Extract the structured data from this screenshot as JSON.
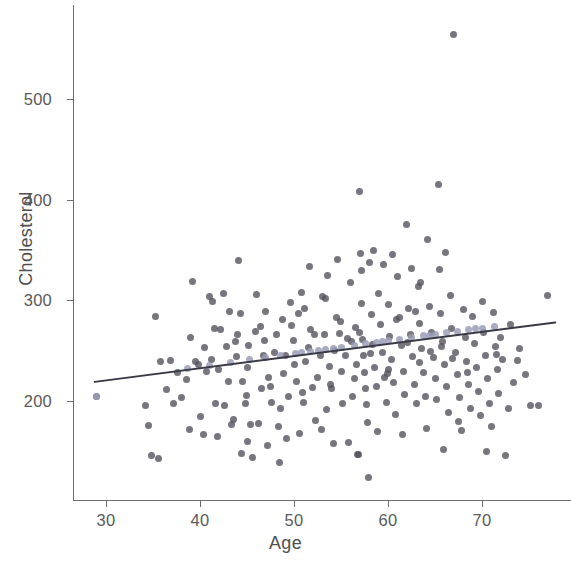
{
  "chart_data": {
    "type": "scatter",
    "title": "",
    "xlabel": "Age",
    "ylabel": "Cholesterol",
    "grid": false,
    "legend": null,
    "xlim": [
      26.5,
      79.5
    ],
    "ylim": [
      110,
      575
    ],
    "xticks": [
      30,
      40,
      50,
      60,
      70
    ],
    "xtick_labels": [
      "30",
      "40",
      "50",
      "60",
      "70"
    ],
    "yticks": [
      200,
      300,
      400,
      500
    ],
    "ytick_labels": [
      "200",
      "300",
      "400",
      "500"
    ],
    "series": [
      {
        "name": "observed",
        "marker": "circle",
        "color": "#55525c",
        "points": [
          [
            29,
            204
          ],
          [
            34.2,
            196
          ],
          [
            34.5,
            176
          ],
          [
            34.8,
            146
          ],
          [
            35.3,
            284
          ],
          [
            35.6,
            143
          ],
          [
            37.2,
            198
          ],
          [
            38.6,
            221
          ],
          [
            38.9,
            172
          ],
          [
            39.2,
            319
          ],
          [
            39.5,
            239
          ],
          [
            39.8,
            236
          ],
          [
            40.1,
            185
          ],
          [
            40.4,
            167
          ],
          [
            40.7,
            229
          ],
          [
            41.0,
            304
          ],
          [
            41.3,
            299
          ],
          [
            41.6,
            198
          ],
          [
            41.9,
            165
          ],
          [
            42.2,
            271
          ],
          [
            42.5,
            307
          ],
          [
            42.8,
            254
          ],
          [
            43.1,
            289
          ],
          [
            43.4,
            177
          ],
          [
            43.6,
            182
          ],
          [
            43.9,
            244
          ],
          [
            44.1,
            340
          ],
          [
            44.3,
            287
          ],
          [
            44.5,
            219
          ],
          [
            44.8,
            198
          ],
          [
            45.0,
            233
          ],
          [
            45.2,
            255
          ],
          [
            45.4,
            177
          ],
          [
            45.6,
            144
          ],
          [
            45.9,
            269
          ],
          [
            46.2,
            178
          ],
          [
            46.5,
            212
          ],
          [
            46.8,
            245
          ],
          [
            47.0,
            289
          ],
          [
            47.3,
            223
          ],
          [
            47.6,
            199
          ],
          [
            47.9,
            248
          ],
          [
            48.1,
            266
          ],
          [
            48.4,
            175
          ],
          [
            48.6,
            193
          ],
          [
            48.9,
            227
          ],
          [
            49.1,
            245
          ],
          [
            49.4,
            204
          ],
          [
            49.6,
            298
          ],
          [
            49.9,
            260
          ],
          [
            50.1,
            236
          ],
          [
            50.3,
            219
          ],
          [
            50.5,
            287
          ],
          [
            50.8,
            308
          ],
          [
            51.0,
            199
          ],
          [
            51.2,
            239
          ],
          [
            51.5,
            253
          ],
          [
            51.8,
            271
          ],
          [
            52.0,
            213
          ],
          [
            52.3,
            181
          ],
          [
            52.5,
            223
          ],
          [
            52.8,
            245
          ],
          [
            53.0,
            304
          ],
          [
            53.2,
            266
          ],
          [
            53.5,
            192
          ],
          [
            53.8,
            234
          ],
          [
            54.0,
            212
          ],
          [
            54.3,
            250
          ],
          [
            54.5,
            283
          ],
          [
            54.8,
            267
          ],
          [
            55.0,
            229
          ],
          [
            55.2,
            198
          ],
          [
            55.5,
            245
          ],
          [
            55.7,
            262
          ],
          [
            56.0,
            318
          ],
          [
            56.2,
            204
          ],
          [
            56.5,
            273
          ],
          [
            56.7,
            236
          ],
          [
            56.9,
            147
          ],
          [
            57.0,
            408
          ],
          [
            57.1,
            347
          ],
          [
            57.2,
            297
          ],
          [
            57.3,
            261
          ],
          [
            57.4,
            245
          ],
          [
            57.5,
            228
          ],
          [
            57.6,
            212
          ],
          [
            57.7,
            197
          ],
          [
            57.8,
            179
          ],
          [
            57.9,
            124
          ],
          [
            58.0,
            338
          ],
          [
            58.2,
            286
          ],
          [
            58.4,
            256
          ],
          [
            58.6,
            233
          ],
          [
            58.8,
            214
          ],
          [
            59.0,
            307
          ],
          [
            59.2,
            276
          ],
          [
            59.4,
            248
          ],
          [
            59.6,
            223
          ],
          [
            59.8,
            199
          ],
          [
            60.0,
            296
          ],
          [
            60.2,
            264
          ],
          [
            60.4,
            241
          ],
          [
            60.6,
            218
          ],
          [
            60.8,
            187
          ],
          [
            61.0,
            324
          ],
          [
            61.2,
            283
          ],
          [
            61.4,
            255
          ],
          [
            61.6,
            229
          ],
          [
            61.8,
            206
          ],
          [
            62.0,
            375
          ],
          [
            62.2,
            292
          ],
          [
            62.4,
            266
          ],
          [
            62.6,
            244
          ],
          [
            62.8,
            216
          ],
          [
            63.0,
            198
          ],
          [
            63.2,
            314
          ],
          [
            63.4,
            277
          ],
          [
            63.6,
            252
          ],
          [
            63.8,
            228
          ],
          [
            64.0,
            204
          ],
          [
            64.2,
            360
          ],
          [
            64.4,
            294
          ],
          [
            64.6,
            268
          ],
          [
            64.8,
            243
          ],
          [
            65.0,
            222
          ],
          [
            65.2,
            201
          ],
          [
            65.4,
            415
          ],
          [
            65.5,
            331
          ],
          [
            65.6,
            287
          ],
          [
            65.8,
            259
          ],
          [
            66.0,
            236
          ],
          [
            66.2,
            214
          ],
          [
            66.4,
            189
          ],
          [
            66.6,
            305
          ],
          [
            66.8,
            272
          ],
          [
            67.0,
            564
          ],
          [
            67.2,
            248
          ],
          [
            67.4,
            226
          ],
          [
            67.6,
            203
          ],
          [
            67.8,
            171
          ],
          [
            68.0,
            291
          ],
          [
            68.2,
            263
          ],
          [
            68.4,
            239
          ],
          [
            68.6,
            216
          ],
          [
            68.8,
            193
          ],
          [
            69.0,
            284
          ],
          [
            69.2,
            257
          ],
          [
            69.4,
            233
          ],
          [
            69.6,
            209
          ],
          [
            69.8,
            186
          ],
          [
            70.0,
            299
          ],
          [
            70.2,
            268
          ],
          [
            70.4,
            245
          ],
          [
            70.6,
            222
          ],
          [
            70.8,
            198
          ],
          [
            71.0,
            175
          ],
          [
            71.2,
            288
          ],
          [
            71.4,
            254
          ],
          [
            71.6,
            231
          ],
          [
            71.8,
            207
          ],
          [
            72.0,
            263
          ],
          [
            72.2,
            241
          ],
          [
            72.5,
            146
          ],
          [
            73.0,
            276
          ],
          [
            73.4,
            218
          ],
          [
            74.0,
            252
          ],
          [
            74.6,
            226
          ],
          [
            75.2,
            196
          ],
          [
            77.0,
            305
          ],
          [
            48.5,
            139
          ],
          [
            44.4,
            148
          ],
          [
            56.8,
            147
          ],
          [
            43.0,
            219
          ],
          [
            42.0,
            231
          ],
          [
            40.5,
            253
          ],
          [
            46.0,
            306
          ],
          [
            51.6,
            334
          ],
          [
            53.6,
            325
          ],
          [
            54.6,
            341
          ],
          [
            58.5,
            350
          ],
          [
            62.5,
            332
          ],
          [
            63.5,
            318
          ],
          [
            66.1,
            348
          ],
          [
            60.5,
            346
          ],
          [
            57.2,
            330
          ],
          [
            59.5,
            336
          ],
          [
            38.0,
            203
          ],
          [
            37.6,
            228
          ],
          [
            36.9,
            240
          ],
          [
            49.2,
            163
          ],
          [
            50.6,
            168
          ],
          [
            52.9,
            172
          ],
          [
            54.2,
            158
          ],
          [
            61.5,
            167
          ],
          [
            65.9,
            152
          ],
          [
            70.5,
            150
          ],
          [
            55.8,
            159
          ],
          [
            47.2,
            156
          ],
          [
            45.1,
            160
          ],
          [
            58.9,
            170
          ],
          [
            64.1,
            173
          ],
          [
            67.5,
            180
          ],
          [
            72.8,
            193
          ],
          [
            76.0,
            196
          ],
          [
            41.2,
            241
          ],
          [
            43.8,
            259
          ],
          [
            46.4,
            274
          ],
          [
            48.8,
            281
          ],
          [
            51.1,
            292
          ],
          [
            53.3,
            302
          ],
          [
            56.1,
            259
          ],
          [
            58.1,
            247
          ],
          [
            60.1,
            231
          ],
          [
            62.1,
            258
          ],
          [
            64.5,
            249
          ],
          [
            66.9,
            242
          ],
          [
            35.8,
            239
          ],
          [
            36.4,
            211
          ],
          [
            39.0,
            263
          ],
          [
            42.6,
            196
          ],
          [
            44.9,
            205
          ],
          [
            47.5,
            214
          ],
          [
            50.9,
            208
          ],
          [
            53.9,
            216
          ],
          [
            56.4,
            222
          ],
          [
            59.9,
            227
          ],
          [
            63.3,
            238
          ],
          [
            65.7,
            254
          ],
          [
            68.5,
            228
          ],
          [
            71.5,
            246
          ],
          [
            73.8,
            240
          ],
          [
            52.2,
            266
          ],
          [
            54.9,
            279
          ],
          [
            57.0,
            268
          ],
          [
            60.9,
            281
          ],
          [
            62.9,
            289
          ],
          [
            49.7,
            275
          ],
          [
            46.9,
            260
          ],
          [
            44.0,
            266
          ],
          [
            41.5,
            272
          ]
        ]
      },
      {
        "name": "fitted",
        "marker": "circle",
        "color": "#9a9db8",
        "points": [
          [
            29,
            204
          ],
          [
            38.7,
            232
          ],
          [
            41.0,
            235
          ],
          [
            43.2,
            238
          ],
          [
            45.3,
            241
          ],
          [
            47.0,
            243
          ],
          [
            48.6,
            245
          ],
          [
            50.2,
            247
          ],
          [
            51.8,
            249
          ],
          [
            53.4,
            251
          ],
          [
            55.0,
            253
          ],
          [
            56.4,
            255
          ],
          [
            57.6,
            257
          ],
          [
            58.8,
            258
          ],
          [
            60.0,
            260
          ],
          [
            61.2,
            261
          ],
          [
            62.5,
            263
          ],
          [
            63.8,
            265
          ],
          [
            65.0,
            266
          ],
          [
            66.2,
            268
          ],
          [
            67.4,
            269
          ],
          [
            68.6,
            271
          ],
          [
            70.0,
            272
          ],
          [
            71.3,
            274
          ],
          [
            50.8,
            248
          ],
          [
            52.6,
            250
          ],
          [
            54.2,
            252
          ],
          [
            59.4,
            259
          ],
          [
            64.4,
            265
          ],
          [
            69.3,
            272
          ]
        ]
      }
    ],
    "regression_line": {
      "color": "#3a3a46",
      "width": 2,
      "x_start": 28.8,
      "y_start": 219,
      "x_end": 77.8,
      "y_end": 278,
      "slope": 1.2,
      "intercept": 184.4
    }
  },
  "axis": {
    "x_title": "Age",
    "y_title": "Cholesterol"
  }
}
